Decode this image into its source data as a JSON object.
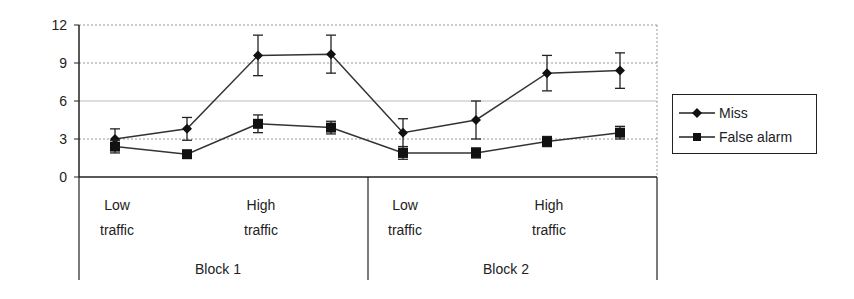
{
  "chart_data": {
    "type": "line",
    "title": "",
    "xlabel": "",
    "ylabel": "",
    "ylim": [
      0,
      12
    ],
    "yticks": [
      "0",
      "3",
      "6",
      "9",
      "12"
    ],
    "grid": true,
    "legend_position": "right",
    "categories": [
      "Block 1 Low traffic (1)",
      "Block 1 Low traffic (2)",
      "Block 1 High traffic (1)",
      "Block 1 High traffic (2)",
      "Block 2 Low traffic (1)",
      "Block 2 Low traffic (2)",
      "Block 2 High traffic (1)",
      "Block 2 High traffic (2)"
    ],
    "category_groups": [
      {
        "block": "Block 1",
        "low": [
          "Low",
          "traffic"
        ],
        "high": [
          "High",
          "traffic"
        ]
      },
      {
        "block": "Block 2",
        "low": [
          "Low",
          "traffic"
        ],
        "high": [
          "High",
          "traffic"
        ]
      }
    ],
    "series": [
      {
        "name": "Miss",
        "marker": "diamond",
        "values": [
          3.0,
          3.8,
          9.6,
          9.7,
          3.5,
          4.5,
          8.2,
          8.4
        ],
        "errors": [
          0.8,
          0.9,
          1.6,
          1.5,
          1.1,
          1.5,
          1.4,
          1.4
        ]
      },
      {
        "name": "False alarm",
        "marker": "square",
        "values": [
          2.4,
          1.8,
          4.2,
          3.9,
          1.9,
          1.9,
          2.8,
          3.5
        ],
        "errors": [
          0.5,
          0.2,
          0.7,
          0.5,
          0.5,
          0.4,
          0.4,
          0.5
        ]
      }
    ]
  },
  "legend": {
    "items": [
      {
        "label": "Miss"
      },
      {
        "label": "False alarm"
      }
    ]
  },
  "axis": {
    "block_labels": [
      "Block 1",
      "Block 2"
    ],
    "low_label": [
      "Low",
      "traffic"
    ],
    "high_label": [
      "High",
      "traffic"
    ]
  }
}
